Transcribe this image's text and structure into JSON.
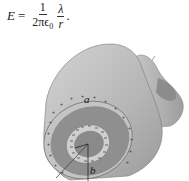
{
  "formula": {
    "lhs": "E",
    "equals": "=",
    "frac1_num": "1",
    "frac1_den": "2πϵ",
    "frac1_den_sub": "0",
    "frac2_num": "λ",
    "frac2_den": "r",
    "trailing": "."
  },
  "figure": {
    "label_a": "a",
    "label_b": "b",
    "outer_charge_sign": "+",
    "inner_charge_sign": "−",
    "colors": {
      "outer_shell": "#b8b8b8",
      "outer_shell_dark": "#8e8e8e",
      "inner_face": "#9a9a9a",
      "insulator": "#c9c9c9",
      "core": "#8a8a8a",
      "axis_line": "#888888"
    }
  }
}
